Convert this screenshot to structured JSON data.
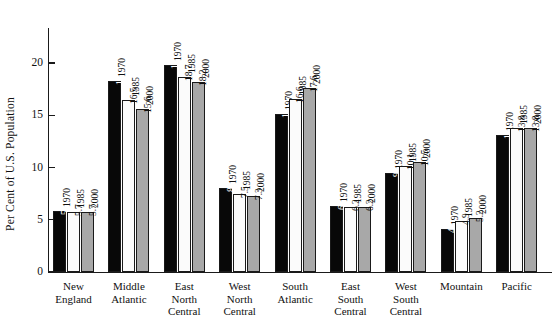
{
  "chart_data": {
    "type": "bar",
    "title": "",
    "xlabel": "",
    "ylabel": "Per Cent of U.S. Population",
    "ylim": [
      0,
      23.5
    ],
    "yticks": [
      0,
      5,
      10,
      15,
      20
    ],
    "ytick_labels": [
      "0",
      "5",
      "10",
      "15",
      "20"
    ],
    "grid": false,
    "legend": "none",
    "series_labels_on_bars": true,
    "categories": [
      "New England",
      "Middle Atlantic",
      "East North Central",
      "West North Central",
      "South Atlantic",
      "East South Central",
      "West South Central",
      "Mountain",
      "Pacific"
    ],
    "category_lines": [
      [
        "New",
        "England"
      ],
      [
        "Middle",
        "Atlantic"
      ],
      [
        "East",
        "North",
        "Central"
      ],
      [
        "West",
        "North",
        "Central"
      ],
      [
        "South",
        "Atlantic"
      ],
      [
        "East",
        "South",
        "Central"
      ],
      [
        "West",
        "South",
        "Central"
      ],
      [
        "Mountain"
      ],
      [
        "Pacific"
      ]
    ],
    "series": [
      {
        "name": "1970",
        "color": "#080808",
        "values": [
          5.8,
          18.3,
          19.8,
          8.0,
          15.1,
          6.3,
          9.5,
          4.1,
          13.1
        ]
      },
      {
        "name": "1985",
        "color": "#fbfbfb",
        "values": [
          5.7,
          16.5,
          18.7,
          7.5,
          16.6,
          6.2,
          10.1,
          4.9,
          13.8
        ]
      },
      {
        "name": "2000",
        "color": "#a8a8a8",
        "values": [
          5.7,
          15.6,
          18.2,
          7.3,
          17.6,
          6.2,
          10.5,
          5.2,
          13.8
        ]
      }
    ],
    "value_labels": [
      [
        "5.8",
        "5.7",
        "5.7"
      ],
      [
        "18.3",
        "16.5",
        "15.6"
      ],
      [
        "19.8",
        "18.7",
        "18.2"
      ],
      [
        "8.0",
        "7.5",
        "7.3"
      ],
      [
        "15.1",
        "16.6",
        "17.6"
      ],
      [
        "6.3",
        "6.2",
        "6.2"
      ],
      [
        "9.5",
        "10.1",
        "10.5"
      ],
      [
        "4.1",
        "4.9",
        "5.2"
      ],
      [
        "13.1",
        "13.8",
        "13.8"
      ]
    ],
    "year_labels": [
      "1970",
      "1985",
      "2000"
    ]
  }
}
